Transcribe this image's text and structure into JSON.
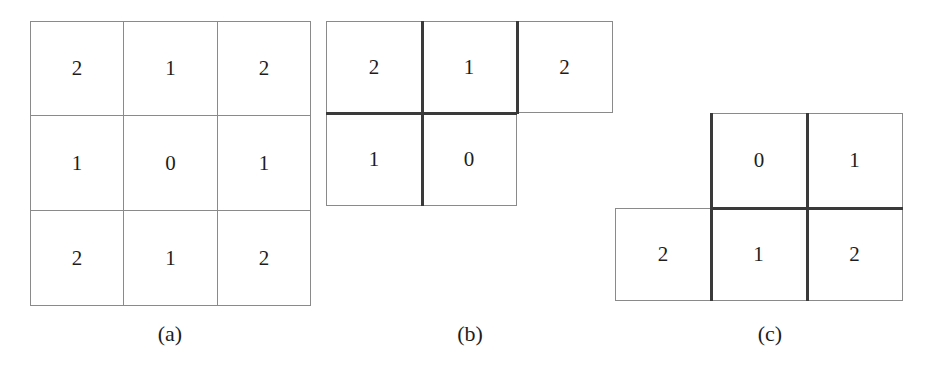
{
  "figure": {
    "background_color": "#ffffff",
    "thin_line_color": "#8a8a8a",
    "thick_line_color": "#3a3a3a",
    "digit_color": "#1d1d1d"
  },
  "panels": [
    {
      "id": "a",
      "caption": "(a)",
      "description": "full 3x3 neighbourhood mask, all separators drawn thin",
      "rows": [
        {
          "offset": 0,
          "cells": [
            "2",
            "1",
            "2"
          ]
        },
        {
          "offset": 0,
          "cells": [
            "1",
            "0",
            "1"
          ]
        },
        {
          "offset": 0,
          "cells": [
            "2",
            "1",
            "2"
          ]
        }
      ]
    },
    {
      "id": "b",
      "caption": "(b)",
      "description": "forward half-mask: top row of three, second row of two",
      "rows": [
        {
          "offset": 0,
          "cells": [
            "2",
            "1",
            "2"
          ]
        },
        {
          "offset": 0,
          "cells": [
            "1",
            "0"
          ]
        }
      ]
    },
    {
      "id": "c",
      "caption": "(c)",
      "description": "backward half-mask: top row of two shifted right, bottom row of three",
      "rows": [
        {
          "offset": 1,
          "cells": [
            "0",
            "1"
          ]
        },
        {
          "offset": 0,
          "cells": [
            "2",
            "1",
            "2"
          ]
        }
      ]
    }
  ],
  "cells": {
    "a": {
      "r0c0": "2",
      "r0c1": "1",
      "r0c2": "2",
      "r1c0": "1",
      "r1c1": "0",
      "r1c2": "1",
      "r2c0": "2",
      "r2c1": "1",
      "r2c2": "2"
    },
    "b": {
      "r0c0": "2",
      "r0c1": "1",
      "r0c2": "2",
      "r1c0": "1",
      "r1c1": "0"
    },
    "c": {
      "r0c1": "0",
      "r0c2": "1",
      "r1c0": "2",
      "r1c1": "1",
      "r1c2": "2"
    }
  },
  "captions": {
    "a": "(a)",
    "b": "(b)",
    "c": "(c)"
  }
}
